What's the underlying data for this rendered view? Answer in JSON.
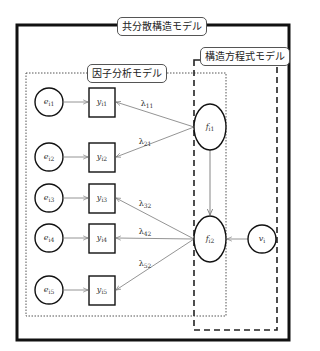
{
  "diagram": {
    "outer_frame": {
      "label": "共分散構造モデル"
    },
    "factor_analysis_box": {
      "label": "因子分析モデル"
    },
    "sem_box": {
      "label": "構造方程式モデル"
    },
    "errors": [
      {
        "id": "e_i1",
        "base": "e",
        "sub": "i1"
      },
      {
        "id": "e_i2",
        "base": "e",
        "sub": "i2"
      },
      {
        "id": "e_i3",
        "base": "e",
        "sub": "i3"
      },
      {
        "id": "e_i4",
        "base": "e",
        "sub": "i4"
      },
      {
        "id": "e_i5",
        "base": "e",
        "sub": "i5"
      }
    ],
    "observed": [
      {
        "id": "y_i1",
        "base": "y",
        "sub": "i1"
      },
      {
        "id": "y_i2",
        "base": "y",
        "sub": "i2"
      },
      {
        "id": "y_i3",
        "base": "y",
        "sub": "i3"
      },
      {
        "id": "y_i4",
        "base": "y",
        "sub": "i4"
      },
      {
        "id": "y_i5",
        "base": "y",
        "sub": "i5"
      }
    ],
    "factors": [
      {
        "id": "f_i1",
        "base": "f",
        "sub": "i1"
      },
      {
        "id": "f_i2",
        "base": "f",
        "sub": "i2"
      }
    ],
    "disturbance": {
      "id": "v_i",
      "base": "v",
      "sub": "i"
    },
    "loadings": [
      {
        "base": "λ",
        "sub": "11",
        "from": "f_i1",
        "to": "y_i1"
      },
      {
        "base": "λ",
        "sub": "21",
        "from": "f_i1",
        "to": "y_i2"
      },
      {
        "base": "λ",
        "sub": "32",
        "from": "f_i2",
        "to": "y_i3"
      },
      {
        "base": "λ",
        "sub": "42",
        "from": "f_i2",
        "to": "y_i4"
      },
      {
        "base": "λ",
        "sub": "52",
        "from": "f_i2",
        "to": "y_i5"
      }
    ]
  }
}
